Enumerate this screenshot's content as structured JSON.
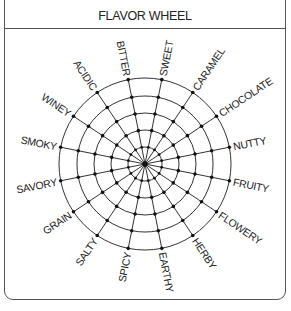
{
  "title": "FLAVOR WHEEL",
  "wheel": {
    "center": [
      145,
      164
    ],
    "ring_radii": [
      17,
      34,
      51,
      68,
      86
    ],
    "spoke_count": 16,
    "line_color": "#333333",
    "dot_color": "#111111",
    "labels": [
      "SWEET",
      "CARAMEL",
      "CHOCOLATE",
      "NUTTY",
      "FRUITY",
      "FLOWERY",
      "HERBY",
      "EARTHY",
      "SPICY",
      "SALTY",
      "GRAIN",
      "SAVORY",
      "SMOKY",
      "WINEY",
      "ACIDIC",
      "BITTER"
    ]
  }
}
